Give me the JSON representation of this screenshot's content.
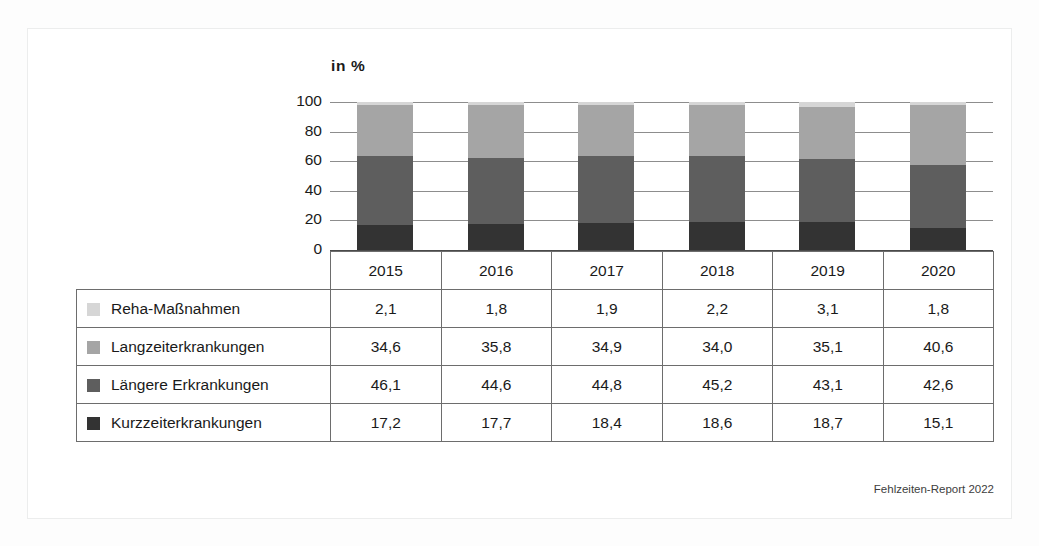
{
  "figure": {
    "axis_title": "in  %",
    "footer": "Fehlzeiten-Report 2022"
  },
  "colors": {
    "reha": "#d6d6d6",
    "langzeit": "#a5a5a5",
    "laengere": "#5e5e5e",
    "kurzzeit": "#333333",
    "gridline": "#8d8d8d",
    "baseline": "#4a4a4a",
    "table_border": "#6d6d6d",
    "frame": "#eceded",
    "text": "#1a1a1a"
  },
  "chart_data": {
    "type": "bar",
    "subtype": "stacked-100-percent",
    "title": "",
    "xlabel": "",
    "ylabel": "in %",
    "ylim": [
      0,
      100
    ],
    "yticks": [
      100,
      80,
      60,
      40,
      20,
      0
    ],
    "grid": true,
    "legend_position": "table-row-labels",
    "categories": [
      "2015",
      "2016",
      "2017",
      "2018",
      "2019",
      "2020"
    ],
    "stack_order_bottom_to_top": [
      "Kurzzeiterkrankungen",
      "Längere Erkrankungen",
      "Langzeiterkrankungen",
      "Reha-Maßnahmen"
    ],
    "series": [
      {
        "name": "Reha-Maßnahmen",
        "swatch": "reha",
        "values": [
          2.1,
          1.8,
          1.9,
          2.2,
          3.1,
          1.8
        ],
        "labels": [
          "2,1",
          "1,8",
          "1,9",
          "2,2",
          "3,1",
          "1,8"
        ]
      },
      {
        "name": "Langzeiterkrankungen",
        "swatch": "langzeit",
        "values": [
          34.6,
          35.8,
          34.9,
          34.0,
          35.1,
          40.6
        ],
        "labels": [
          "34,6",
          "35,8",
          "34,9",
          "34,0",
          "35,1",
          "40,6"
        ]
      },
      {
        "name": "Längere Erkrankungen",
        "swatch": "laengere",
        "values": [
          46.1,
          44.6,
          44.8,
          45.2,
          43.1,
          42.6
        ],
        "labels": [
          "46,1",
          "44,6",
          "44,8",
          "45,2",
          "43,1",
          "42,6"
        ]
      },
      {
        "name": "Kurzzeiterkrankungen",
        "swatch": "kurzzeit",
        "values": [
          17.2,
          17.7,
          18.4,
          18.6,
          18.7,
          15.1
        ],
        "labels": [
          "17,2",
          "17,7",
          "18,4",
          "18,6",
          "18,7",
          "15,1"
        ]
      }
    ]
  },
  "table": {
    "corner_label": "",
    "column_headers": [
      "2015",
      "2016",
      "2017",
      "2018",
      "2019",
      "2020"
    ],
    "rows": [
      {
        "label": "Reha-Maßnahmen",
        "swatch": "reha",
        "cells": [
          "2,1",
          "1,8",
          "1,9",
          "2,2",
          "3,1",
          "1,8"
        ]
      },
      {
        "label": "Langzeiterkrankungen",
        "swatch": "langzeit",
        "cells": [
          "34,6",
          "35,8",
          "34,9",
          "34,0",
          "35,1",
          "40,6"
        ]
      },
      {
        "label": "Längere Erkrankungen",
        "swatch": "laengere",
        "cells": [
          "46,1",
          "44,6",
          "44,8",
          "45,2",
          "43,1",
          "42,6"
        ]
      },
      {
        "label": "Kurzzeiterkrankungen",
        "swatch": "kurzzeit",
        "cells": [
          "17,2",
          "17,7",
          "18,4",
          "18,6",
          "18,7",
          "15,1"
        ]
      }
    ]
  }
}
